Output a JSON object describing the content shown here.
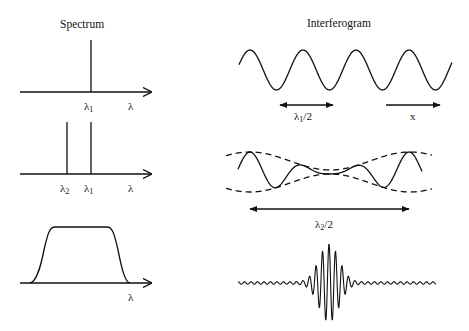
{
  "spectrum": {
    "title": "Spectrum",
    "panel1": {
      "peak_label": "λ",
      "peak_sub": "1",
      "axis_label": "λ"
    },
    "panel2": {
      "peak2_label": "λ",
      "peak2_sub": "2",
      "peak1_label": "λ",
      "peak1_sub": "1",
      "axis_label": "λ"
    },
    "panel3": {
      "axis_label": "λ"
    }
  },
  "interferogram": {
    "title": "Interferogram",
    "panel1": {
      "period_label": "λ",
      "period_sub": "1",
      "period_suffix": "/2",
      "axis_label": "x"
    },
    "panel2": {
      "beat_label": "λ",
      "beat_sub": "2",
      "beat_suffix": "/2"
    },
    "panel3": {}
  },
  "colors": {
    "ink": "#111111",
    "background": "#ffffff"
  }
}
